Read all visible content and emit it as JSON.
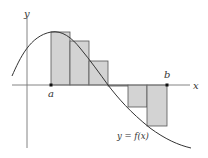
{
  "figure": {
    "type": "riemann-sum-diagram",
    "axis_labels": {
      "x": "x",
      "y": "y"
    },
    "point_labels": {
      "a": "a",
      "b": "b"
    },
    "curve_label": "y = f(x)",
    "colors": {
      "rect_fill": "#d3d3d3",
      "rect_stroke": "#555555",
      "axis": "#777777",
      "curve": "#333333"
    },
    "rectangles": [
      {
        "x0": 51,
        "x1": 70,
        "top": 32,
        "bottom": 85
      },
      {
        "x0": 70,
        "x1": 89,
        "top": 41,
        "bottom": 85
      },
      {
        "x0": 89,
        "x1": 108,
        "top": 61,
        "bottom": 85
      },
      {
        "x0": 108,
        "x1": 128,
        "top": 85,
        "bottom": 86
      },
      {
        "x0": 128,
        "x1": 147,
        "top": 85,
        "bottom": 107
      },
      {
        "x0": 147,
        "x1": 167,
        "top": 85,
        "bottom": 126
      }
    ],
    "num_subintervals": 6
  }
}
